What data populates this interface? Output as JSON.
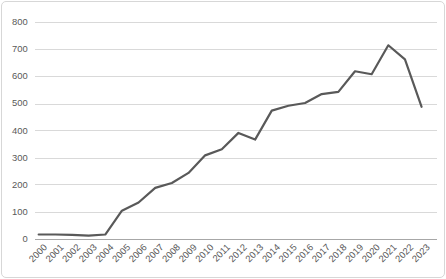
{
  "chart_data": {
    "type": "line",
    "title": "",
    "xlabel": "",
    "ylabel": "",
    "categories": [
      "2000",
      "2001",
      "2002",
      "2003",
      "2004",
      "2005",
      "2006",
      "2007",
      "2008",
      "2009",
      "2010",
      "2011",
      "2012",
      "2013",
      "2014",
      "2015",
      "2016",
      "2017",
      "2018",
      "2019",
      "2020",
      "2021",
      "2022",
      "2023"
    ],
    "values": [
      15,
      15,
      14,
      11,
      15,
      103,
      133,
      187,
      205,
      242,
      307,
      330,
      390,
      365,
      472,
      490,
      500,
      533,
      541,
      617,
      606,
      713,
      661,
      486
    ],
    "ylim": [
      0,
      800
    ],
    "ytick_interval": 100,
    "ytick_labels": [
      "0",
      "100",
      "200",
      "300",
      "400",
      "500",
      "600",
      "700",
      "800"
    ],
    "grid": "horizontal",
    "legend": "none",
    "x_label_rotation_deg": -45,
    "colors": {
      "series_line": "#595959",
      "gridline": "#d9d9d9",
      "axis_line": "#a6a6a6",
      "tick_label": "#595959",
      "background": "#ffffff",
      "frame_border": "#d7d7d7"
    }
  }
}
